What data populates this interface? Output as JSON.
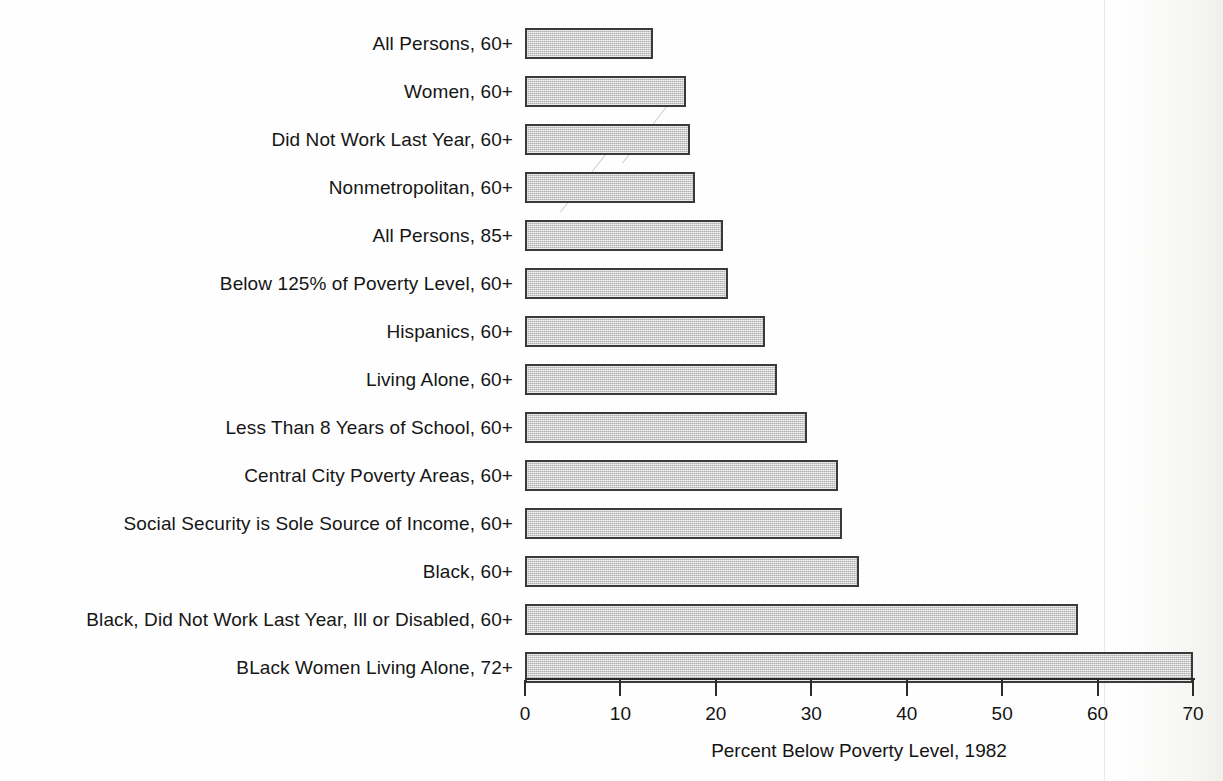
{
  "chart_data": {
    "type": "bar",
    "orientation": "horizontal",
    "title": "",
    "xlabel": "Percent Below Poverty Level, 1982",
    "ylabel": "",
    "xlim": [
      0,
      70
    ],
    "xticks": [
      0,
      10,
      20,
      30,
      40,
      50,
      60,
      70
    ],
    "xtick_labels": [
      "0",
      "10",
      "20",
      "30",
      "40",
      "50",
      "60",
      "70"
    ],
    "grid": false,
    "legend": null,
    "bar_fill_color": "#c9c9c9",
    "bar_edge_color": "#3a3a3a",
    "categories": [
      "All Persons, 60+",
      "Women, 60+",
      "Did Not Work Last Year, 60+",
      "Nonmetropolitan, 60+",
      "All Persons, 85+",
      "Below 125% of Poverty Level, 60+",
      "Hispanics, 60+",
      "Living Alone, 60+",
      "Less Than 8 Years of School, 60+",
      "Central City Poverty Areas, 60+",
      "Social Security is Sole Source of Income, 60+",
      "Black, 60+",
      "Black, Did Not Work Last Year, Ill or Disabled, 60+",
      "BLack Women Living Alone, 72+"
    ],
    "values": [
      13.4,
      16.9,
      17.3,
      17.8,
      20.7,
      21.3,
      25.1,
      26.4,
      29.6,
      32.8,
      33.2,
      35.0,
      57.9,
      70.0
    ]
  },
  "axis": {
    "title": "Percent Below Poverty Level, 1982",
    "tick_labels": [
      "0",
      "10",
      "20",
      "30",
      "40",
      "50",
      "60",
      "70"
    ]
  }
}
